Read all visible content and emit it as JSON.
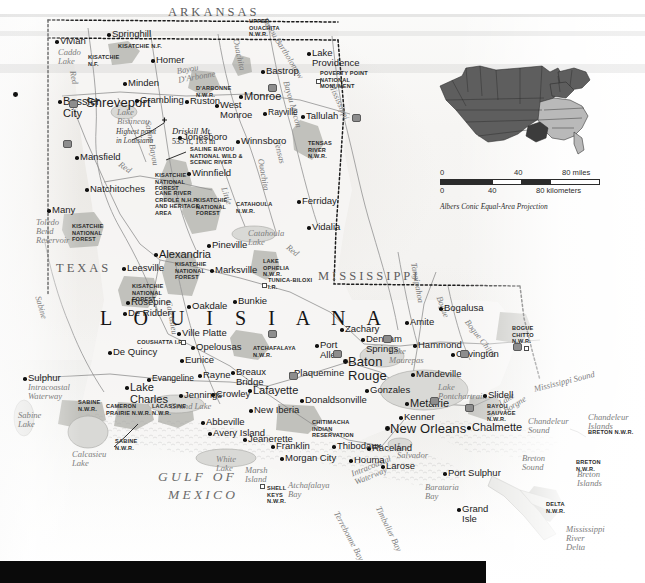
{
  "map": {
    "title": "Louisiana",
    "state_big_label": "L O U I S I A N A",
    "neighbor_states": [
      {
        "name": "ARKANSAS",
        "x": 168,
        "y": 6
      },
      {
        "name": "TEXAS",
        "x": 56,
        "y": 262
      },
      {
        "name": "MISSISSIPPI",
        "x": 318,
        "y": 270
      }
    ],
    "gulf_label": "GULF OF",
    "gulf_label2": "MEXICO",
    "cities": [
      {
        "name": "Shreveport",
        "x": 18,
        "y": 88,
        "size": "xl",
        "dx": 68,
        "dy": 8
      },
      {
        "name": "Bossier\nCity",
        "x": 63,
        "y": 96,
        "size": "lg"
      },
      {
        "name": "Vivian",
        "x": 60,
        "y": 36,
        "size": "md"
      },
      {
        "name": "Springhill",
        "x": 112,
        "y": 29,
        "size": "md"
      },
      {
        "name": "Homer",
        "x": 156,
        "y": 55,
        "size": "md"
      },
      {
        "name": "Minden",
        "x": 128,
        "y": 78,
        "size": "md"
      },
      {
        "name": "Grambling",
        "x": 140,
        "y": 95,
        "size": "md"
      },
      {
        "name": "Ruston",
        "x": 190,
        "y": 96,
        "size": "md"
      },
      {
        "name": "West\nMonroe",
        "x": 220,
        "y": 100,
        "size": "md"
      },
      {
        "name": "Monroe",
        "x": 244,
        "y": 91,
        "size": "lg"
      },
      {
        "name": "Bastrop",
        "x": 266,
        "y": 66,
        "size": "md"
      },
      {
        "name": "Lake\nProvidence",
        "x": 312,
        "y": 48,
        "size": "md"
      },
      {
        "name": "Tallulah",
        "x": 306,
        "y": 111,
        "size": "md"
      },
      {
        "name": "Rayville",
        "x": 268,
        "y": 108,
        "size": "sm"
      },
      {
        "name": "Winnsboro",
        "x": 241,
        "y": 136,
        "size": "md"
      },
      {
        "name": "Jonesboro",
        "x": 183,
        "y": 132,
        "size": "md"
      },
      {
        "name": "Winnfield",
        "x": 192,
        "y": 168,
        "size": "md"
      },
      {
        "name": "Mansfield",
        "x": 80,
        "y": 152,
        "size": "md"
      },
      {
        "name": "Natchitoches",
        "x": 90,
        "y": 184,
        "size": "md"
      },
      {
        "name": "Many",
        "x": 52,
        "y": 205,
        "size": "md"
      },
      {
        "name": "Ferriday",
        "x": 302,
        "y": 196,
        "size": "md"
      },
      {
        "name": "Vidalia",
        "x": 312,
        "y": 222,
        "size": "md"
      },
      {
        "name": "Alexandria",
        "x": 159,
        "y": 249,
        "size": "lg"
      },
      {
        "name": "Pineville",
        "x": 212,
        "y": 240,
        "size": "md"
      },
      {
        "name": "Leesville",
        "x": 127,
        "y": 263,
        "size": "md"
      },
      {
        "name": "Marksville",
        "x": 215,
        "y": 265,
        "size": "md"
      },
      {
        "name": "Rosepine",
        "x": 131,
        "y": 297,
        "size": "md"
      },
      {
        "name": "De Ridder",
        "x": 128,
        "y": 308,
        "size": "md"
      },
      {
        "name": "Oakdale",
        "x": 192,
        "y": 301,
        "size": "md"
      },
      {
        "name": "Bunkie",
        "x": 238,
        "y": 296,
        "size": "md"
      },
      {
        "name": "Ville Platte",
        "x": 182,
        "y": 328,
        "size": "md"
      },
      {
        "name": "Opelousas",
        "x": 196,
        "y": 342,
        "size": "md"
      },
      {
        "name": "Eunice",
        "x": 185,
        "y": 355,
        "size": "md"
      },
      {
        "name": "De Quincy",
        "x": 113,
        "y": 347,
        "size": "md"
      },
      {
        "name": "Sulphur",
        "x": 28,
        "y": 373,
        "size": "md"
      },
      {
        "name": "Lake\nCharles",
        "x": 130,
        "y": 382,
        "size": "lg"
      },
      {
        "name": "Evangeline",
        "x": 152,
        "y": 374,
        "size": "sm"
      },
      {
        "name": "Jennings",
        "x": 184,
        "y": 390,
        "size": "md"
      },
      {
        "name": "Rayne",
        "x": 203,
        "y": 370,
        "size": "md"
      },
      {
        "name": "Crowley",
        "x": 216,
        "y": 389,
        "size": "md"
      },
      {
        "name": "Breaux\nBridge",
        "x": 236,
        "y": 367,
        "size": "md"
      },
      {
        "name": "Lafayette",
        "x": 253,
        "y": 385,
        "size": "lg"
      },
      {
        "name": "Abbeville",
        "x": 206,
        "y": 417,
        "size": "md"
      },
      {
        "name": "Avery Island",
        "x": 213,
        "y": 428,
        "size": "md"
      },
      {
        "name": "New Iberia",
        "x": 254,
        "y": 405,
        "size": "md"
      },
      {
        "name": "Jeanerette",
        "x": 248,
        "y": 434,
        "size": "md"
      },
      {
        "name": "Franklin",
        "x": 276,
        "y": 441,
        "size": "md"
      },
      {
        "name": "Morgan City",
        "x": 285,
        "y": 453,
        "size": "md"
      },
      {
        "name": "Thibodaux",
        "x": 337,
        "y": 441,
        "size": "md"
      },
      {
        "name": "Houma",
        "x": 354,
        "y": 455,
        "size": "md"
      },
      {
        "name": "Larose",
        "x": 386,
        "y": 461,
        "size": "md"
      },
      {
        "name": "Plaquemine",
        "x": 294,
        "y": 368,
        "size": "md"
      },
      {
        "name": "Donaldsonville",
        "x": 305,
        "y": 395,
        "size": "md"
      },
      {
        "name": "Baton\nRouge",
        "x": 348,
        "y": 355,
        "size": "xl"
      },
      {
        "name": "Port\nAllen",
        "x": 320,
        "y": 340,
        "size": "md"
      },
      {
        "name": "Zachary",
        "x": 345,
        "y": 324,
        "size": "md"
      },
      {
        "name": "Denham\nSprings",
        "x": 366,
        "y": 334,
        "size": "md"
      },
      {
        "name": "Gonzales",
        "x": 370,
        "y": 385,
        "size": "md"
      },
      {
        "name": "Amite",
        "x": 410,
        "y": 317,
        "size": "md"
      },
      {
        "name": "Hammond",
        "x": 418,
        "y": 340,
        "size": "md"
      },
      {
        "name": "Bogalusa",
        "x": 444,
        "y": 303,
        "size": "md"
      },
      {
        "name": "Covington",
        "x": 456,
        "y": 349,
        "size": "md"
      },
      {
        "name": "Mandeville",
        "x": 416,
        "y": 369,
        "size": "md"
      },
      {
        "name": "Slidell",
        "x": 488,
        "y": 390,
        "size": "md"
      },
      {
        "name": "Metairie",
        "x": 410,
        "y": 398,
        "size": "lg"
      },
      {
        "name": "Kenner",
        "x": 404,
        "y": 412,
        "size": "md"
      },
      {
        "name": "New Orleans",
        "x": 390,
        "y": 422,
        "size": "xl"
      },
      {
        "name": "Chalmette",
        "x": 472,
        "y": 422,
        "size": "lg"
      },
      {
        "name": "Raceland",
        "x": 372,
        "y": 443,
        "size": "md"
      },
      {
        "name": "Port Sulphur",
        "x": 448,
        "y": 468,
        "size": "md"
      },
      {
        "name": "Grand\nIsle",
        "x": 462,
        "y": 504,
        "size": "md"
      }
    ],
    "protected_areas": [
      {
        "name": "UPPER\nOUACHITA\nN.W.R.",
        "x": 249,
        "y": 18
      },
      {
        "name": "KISATCHIE N.F.",
        "x": 118,
        "y": 43
      },
      {
        "name": "KISATCHIE\nN.F.",
        "x": 88,
        "y": 54
      },
      {
        "name": "D'ARBONNE\nN.W.R.",
        "x": 196,
        "y": 85
      },
      {
        "name": "POVERTY POINT\nNATIONAL\nMONUMENT",
        "x": 320,
        "y": 70
      },
      {
        "name": "TENSAS\nRIVER\nN.W.R.",
        "x": 308,
        "y": 140
      },
      {
        "name": "SALINE BAYOU\nNATIONAL WILD &\nSCENIC RIVER",
        "x": 190,
        "y": 146
      },
      {
        "name": "KISATCHIE\nNATIONAL\nFOREST",
        "x": 155,
        "y": 172
      },
      {
        "name": "CANE RIVER\nCREOLE N.H.P.\nAND HERITAGE\nAREA",
        "x": 155,
        "y": 190
      },
      {
        "name": "KISATCHIE\nNATIONAL\nFOREST",
        "x": 196,
        "y": 197
      },
      {
        "name": "CATAHOULA\nN.W.R.",
        "x": 236,
        "y": 201
      },
      {
        "name": "KISATCHIE\nNATIONAL\nFOREST",
        "x": 72,
        "y": 223
      },
      {
        "name": "KISATCHIE\nNATIONAL\nFOREST",
        "x": 175,
        "y": 261
      },
      {
        "name": "LAKE\nOPHELIA\nN.W.R.",
        "x": 263,
        "y": 258
      },
      {
        "name": "TUNICA-BILOXI\nI.R.",
        "x": 268,
        "y": 277
      },
      {
        "name": "KISATCHIE\nNATIONAL\nFOREST",
        "x": 132,
        "y": 283
      },
      {
        "name": "COUSHATTA I.R.",
        "x": 137,
        "y": 339
      },
      {
        "name": "ATCHAFALAYA\nN.W.R.",
        "x": 253,
        "y": 345
      },
      {
        "name": "BOGUE\nCHITTO\nN.W.R.",
        "x": 512,
        "y": 325
      },
      {
        "name": "SABINE\nN.W.R.",
        "x": 78,
        "y": 399
      },
      {
        "name": "CAMERON\nPRAIRIE N.W.R.",
        "x": 106,
        "y": 403
      },
      {
        "name": "LACASSINE\nN.W.R.",
        "x": 152,
        "y": 403
      },
      {
        "name": "SABINE\nN.W.R.",
        "x": 115,
        "y": 438
      },
      {
        "name": "CHITIMACHA\nINDIAN\nRESERVATION",
        "x": 312,
        "y": 419
      },
      {
        "name": "SHELL\nKEYS\nN.W.R.",
        "x": 267,
        "y": 485
      },
      {
        "name": "BAYOU\nSAUVAGE\nN.W.R.",
        "x": 487,
        "y": 403
      },
      {
        "name": "DELTA\nN.W.R.",
        "x": 546,
        "y": 501
      },
      {
        "name": "BRETON N.W.R.",
        "x": 588,
        "y": 429
      },
      {
        "name": "BRETON\nN.W.R.",
        "x": 576,
        "y": 459
      }
    ],
    "water_features": [
      {
        "name": "Caddo\nLake",
        "x": 58,
        "y": 48,
        "size": "sm"
      },
      {
        "name": "Bayou\nD'Arbonne",
        "x": 176,
        "y": 67,
        "size": "sm",
        "rot": -10
      },
      {
        "name": "Ouachita",
        "x": 240,
        "y": 38,
        "size": "sm",
        "rot": 78
      },
      {
        "name": "Bayou Bartholomew",
        "x": 268,
        "y": 16,
        "size": "sm",
        "rot": 58
      },
      {
        "name": "Red",
        "x": 77,
        "y": 70,
        "size": "sm",
        "rot": 80
      },
      {
        "name": "Lake\nBistineau",
        "x": 117,
        "y": 108,
        "size": "sm"
      },
      {
        "name": "Saline Bayou",
        "x": 152,
        "y": 120,
        "size": "sm",
        "rot": 80
      },
      {
        "name": "Red",
        "x": 122,
        "y": 160,
        "size": "sm",
        "rot": 35
      },
      {
        "name": "Bayou Macon",
        "x": 290,
        "y": 80,
        "size": "sm",
        "rot": 74
      },
      {
        "name": "Tensas",
        "x": 281,
        "y": 140,
        "size": "sm",
        "rot": 76
      },
      {
        "name": "Ouachita",
        "x": 265,
        "y": 158,
        "size": "sm",
        "rot": 80
      },
      {
        "name": "Mississippi",
        "x": 335,
        "y": 82,
        "size": "sm",
        "rot": 66
      },
      {
        "name": "Little",
        "x": 228,
        "y": 186,
        "size": "sm",
        "rot": 72
      },
      {
        "name": "Toledo\nBend\nReservoir",
        "x": 36,
        "y": 218,
        "size": "sm"
      },
      {
        "name": "Catahoula\nLake",
        "x": 248,
        "y": 229,
        "size": "sm"
      },
      {
        "name": "Red",
        "x": 290,
        "y": 243,
        "size": "sm",
        "rot": 38
      },
      {
        "name": "Sabine",
        "x": 42,
        "y": 295,
        "size": "sm",
        "rot": 74
      },
      {
        "name": "Calcasieu",
        "x": 173,
        "y": 300,
        "size": "sm",
        "rot": 80
      },
      {
        "name": "Intracoastal\nWaterway",
        "x": 28,
        "y": 383,
        "size": "sm"
      },
      {
        "name": "Sabine\nLake",
        "x": 18,
        "y": 411,
        "size": "sm"
      },
      {
        "name": "Calcasieu\nLake",
        "x": 72,
        "y": 450,
        "size": "sm"
      },
      {
        "name": "Grand Lake",
        "x": 170,
        "y": 402,
        "size": "sm"
      },
      {
        "name": "White\nLake",
        "x": 216,
        "y": 455,
        "size": "sm"
      },
      {
        "name": "Marsh\nIsland",
        "x": 245,
        "y": 466,
        "size": "sm"
      },
      {
        "name": "Atchafalaya\nBay",
        "x": 288,
        "y": 481,
        "size": "sm"
      },
      {
        "name": "Intracoastal\nWaterway",
        "x": 350,
        "y": 470,
        "size": "sm",
        "rot": -22
      },
      {
        "name": "Terrebonne Bay",
        "x": 340,
        "y": 510,
        "size": "sm",
        "rot": 62
      },
      {
        "name": "Timbalier Bay",
        "x": 382,
        "y": 505,
        "size": "sm",
        "rot": 64
      },
      {
        "name": "Barataria\nBay",
        "x": 425,
        "y": 483,
        "size": "sm"
      },
      {
        "name": "L.\nSalvador",
        "x": 397,
        "y": 442,
        "size": "sm"
      },
      {
        "name": "Lake\nMaurepas",
        "x": 389,
        "y": 347,
        "size": "sm"
      },
      {
        "name": "Lake\nPontchartrain",
        "x": 438,
        "y": 383,
        "size": "sm"
      },
      {
        "name": "Lake\nBorgne",
        "x": 497,
        "y": 400,
        "size": "sm",
        "rot": -32
      },
      {
        "name": "Mississippi Sound",
        "x": 533,
        "y": 385,
        "size": "sm",
        "rot": -14
      },
      {
        "name": "Chandeleur\nSound",
        "x": 528,
        "y": 417,
        "size": "sm"
      },
      {
        "name": "Chandeleur\nIslands",
        "x": 588,
        "y": 413,
        "size": "sm"
      },
      {
        "name": "Breton\nSound",
        "x": 522,
        "y": 454,
        "size": "sm"
      },
      {
        "name": "Breton\nIslands",
        "x": 577,
        "y": 470,
        "size": "sm"
      },
      {
        "name": "Mississippi\nRiver\nDelta",
        "x": 566,
        "y": 525,
        "size": "sm"
      },
      {
        "name": "Bogue Chitto",
        "x": 470,
        "y": 318,
        "size": "sm",
        "rot": 52
      },
      {
        "name": "Tangipahoa",
        "x": 418,
        "y": 262,
        "size": "sm",
        "rot": 80
      },
      {
        "name": "Bogue",
        "x": 443,
        "y": 295,
        "size": "sm",
        "rot": 70
      }
    ],
    "annotations": {
      "highest_point": "Highest point\nin Louisiana",
      "peak_name": "Driskill Mt.",
      "peak_elev": "535 ft, 163 m"
    },
    "locator": {
      "name": "united-states-locator",
      "highlight_state": "Louisiana",
      "colors": {
        "base_states": "#5e5e5e",
        "region_states": "#b9b9b9",
        "highlight": "#3c3c3c",
        "border": "#2b2b2b"
      }
    },
    "scale": {
      "miles": {
        "ticks": [
          "0",
          "40",
          "80 miles"
        ]
      },
      "kilometers": {
        "ticks": [
          "0",
          "40",
          "80 kilometers"
        ]
      },
      "projection": "Albers Conic Equal-Area Projection"
    }
  }
}
